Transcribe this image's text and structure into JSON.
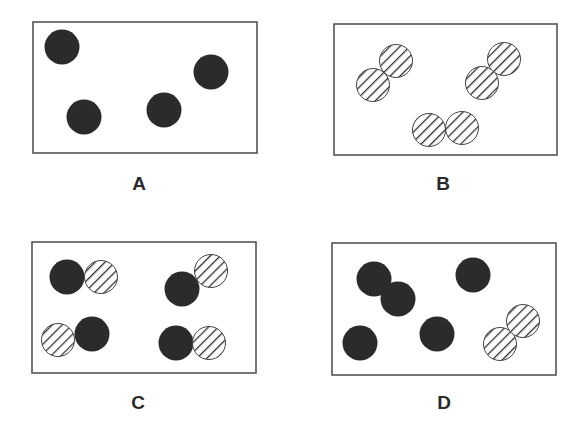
{
  "colors": {
    "background": "#ffffff",
    "border": "#555555",
    "solid_particle": "#2b2b2b",
    "hatch_line": "#333333"
  },
  "legend": {
    "solid": "solid black circle (atom type 1)",
    "hatched": "diagonally hatched circle (atom type 2)"
  },
  "panels": [
    {
      "id": "A",
      "label": "A",
      "box": {
        "x": 33,
        "y": 22,
        "w": 224,
        "h": 131
      },
      "particles": [
        {
          "type": "solid",
          "cx": 62,
          "cy": 47
        },
        {
          "type": "solid",
          "cx": 84,
          "cy": 117
        },
        {
          "type": "solid",
          "cx": 164,
          "cy": 110
        },
        {
          "type": "solid",
          "cx": 211,
          "cy": 72
        }
      ],
      "label_pos": {
        "x": 139,
        "y": 190
      }
    },
    {
      "id": "B",
      "label": "B",
      "box": {
        "x": 334,
        "y": 24,
        "w": 223,
        "h": 131
      },
      "particles": [
        {
          "type": "hatched",
          "cx": 373,
          "cy": 85
        },
        {
          "type": "hatched",
          "cx": 396,
          "cy": 61
        },
        {
          "type": "hatched",
          "cx": 482,
          "cy": 83
        },
        {
          "type": "hatched",
          "cx": 504,
          "cy": 59
        },
        {
          "type": "hatched",
          "cx": 429,
          "cy": 130
        },
        {
          "type": "hatched",
          "cx": 462,
          "cy": 128
        }
      ],
      "label_pos": {
        "x": 443,
        "y": 190
      }
    },
    {
      "id": "C",
      "label": "C",
      "box": {
        "x": 32,
        "y": 242,
        "w": 224,
        "h": 131
      },
      "particles": [
        {
          "type": "solid",
          "cx": 67,
          "cy": 277
        },
        {
          "type": "hatched",
          "cx": 101,
          "cy": 277
        },
        {
          "type": "hatched",
          "cx": 211,
          "cy": 271
        },
        {
          "type": "solid",
          "cx": 182,
          "cy": 289
        },
        {
          "type": "hatched",
          "cx": 58,
          "cy": 340
        },
        {
          "type": "solid",
          "cx": 92,
          "cy": 334
        },
        {
          "type": "solid",
          "cx": 176,
          "cy": 343
        },
        {
          "type": "hatched",
          "cx": 209,
          "cy": 343
        }
      ],
      "label_pos": {
        "x": 138,
        "y": 409
      }
    },
    {
      "id": "D",
      "label": "D",
      "box": {
        "x": 332,
        "y": 243,
        "w": 224,
        "h": 132
      },
      "particles": [
        {
          "type": "solid",
          "cx": 374,
          "cy": 279
        },
        {
          "type": "solid",
          "cx": 398,
          "cy": 299
        },
        {
          "type": "solid",
          "cx": 473,
          "cy": 275
        },
        {
          "type": "solid",
          "cx": 360,
          "cy": 343
        },
        {
          "type": "solid",
          "cx": 437,
          "cy": 334
        },
        {
          "type": "hatched",
          "cx": 500,
          "cy": 344
        },
        {
          "type": "hatched",
          "cx": 523,
          "cy": 321
        }
      ],
      "label_pos": {
        "x": 444,
        "y": 409
      }
    }
  ]
}
